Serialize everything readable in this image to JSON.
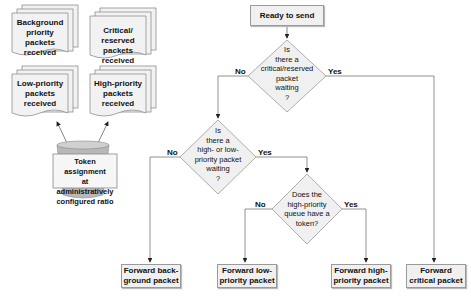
{
  "diagram": {
    "type": "flowchart",
    "sources": [
      {
        "id": "background",
        "label": "Background priority packets received"
      },
      {
        "id": "critical",
        "label": "Critical/ reserved packets received"
      },
      {
        "id": "low",
        "label": "Low-priority packets received"
      },
      {
        "id": "high",
        "label": "High-priority packets received"
      }
    ],
    "token_bucket": {
      "label": "Token assignment at administratively configured ratio"
    },
    "start": {
      "label": "Ready to send"
    },
    "decisions": [
      {
        "id": "d1",
        "label": "Is there a critical/reserved packet waiting ?",
        "no": "No",
        "yes": "Yes"
      },
      {
        "id": "d2",
        "label": "Is there a high- or low-priority packet waiting ?",
        "no": "No",
        "yes": "Yes"
      },
      {
        "id": "d3",
        "label": "Does the high-priority queue have a token?",
        "no": "No",
        "yes": "Yes"
      }
    ],
    "outputs": [
      {
        "id": "out_bg",
        "label": "Forward back-ground packet"
      },
      {
        "id": "out_low",
        "label": "Forward low-priority packet"
      },
      {
        "id": "out_high",
        "label": "Forward high-priority packet"
      },
      {
        "id": "out_crit",
        "label": "Forward critical packet"
      }
    ],
    "colors": {
      "shape_fill": "#f0f0f0",
      "stroke": "#9a9a9a",
      "line": "#777777",
      "bucket": "#b5b5b5"
    }
  },
  "text": {
    "src_bg_1": "Background",
    "src_bg_2": "priority packets",
    "src_bg_3": "received",
    "src_crit_1": "Critical/ reserved",
    "src_crit_2": "packets received",
    "src_low_1": "Low-priority",
    "src_low_2": "packets",
    "src_low_3": "received",
    "src_high_1": "High-priority",
    "src_high_2": "packets",
    "src_high_3": "received",
    "bucket_1": "Token assignment",
    "bucket_2": "at administratively",
    "bucket_3": "configured ratio",
    "start": "Ready to send",
    "d1_1": "Is",
    "d1_2": "there a",
    "d1_3": "critical/reserved",
    "d1_4": "packet",
    "d1_5": "waiting",
    "d1_6": "?",
    "d2_1": "Is",
    "d2_2": "there a",
    "d2_3": "high- or low-",
    "d2_4": "priority packet",
    "d2_5": "waiting",
    "d2_6": "?",
    "d3_1": "Does the",
    "d3_2": "high-priority",
    "d3_3": "queue have a",
    "d3_4": "token?",
    "no": "No",
    "yes": "Yes",
    "out_bg_1": "Forward back-",
    "out_bg_2": "ground packet",
    "out_low_1": "Forward low-",
    "out_low_2": "priority packet",
    "out_high_1": "Forward high-",
    "out_high_2": "priority packet",
    "out_crit_1": "Forward",
    "out_crit_2": "critical packet"
  }
}
